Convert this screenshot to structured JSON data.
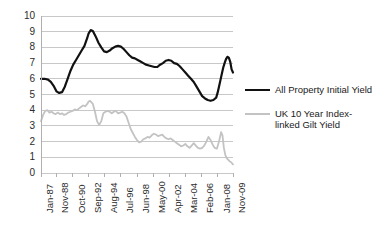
{
  "chart_data": {
    "type": "line",
    "title": "",
    "subtitle": "",
    "xlabel": "",
    "ylabel": "",
    "ylim": [
      0,
      10
    ],
    "ytick_labels": [
      "0",
      "1",
      "2",
      "3",
      "4",
      "5",
      "6",
      "7",
      "8",
      "9",
      "10"
    ],
    "ytick_values": [
      0,
      1,
      2,
      3,
      4,
      5,
      6,
      7,
      8,
      9,
      10
    ],
    "grid": true,
    "legend_position": "right",
    "xtick_labels": [
      "Jan-87",
      "Nov-88",
      "Oct-90",
      "Sep-92",
      "Aug-94",
      "Jul-96",
      "Jun-98",
      "May-00",
      "Apr-02",
      "Mar-04",
      "Feb-06",
      "Jan-08",
      "Nov-09"
    ],
    "xtick_positions": [
      0,
      22,
      45,
      68,
      91,
      114,
      137,
      160,
      183,
      206,
      229,
      252,
      274
    ],
    "x_range": [
      0,
      274
    ],
    "x_unit": "months since Jan-1987",
    "series": [
      {
        "name": "All Property Initial Yield",
        "color": "#111111",
        "width": 2.2,
        "x": [
          0,
          5,
          10,
          14,
          18,
          22,
          26,
          30,
          34,
          38,
          42,
          46,
          50,
          54,
          58,
          62,
          66,
          68,
          71,
          74,
          78,
          82,
          86,
          90,
          94,
          98,
          102,
          106,
          110,
          114,
          118,
          122,
          126,
          130,
          134,
          138,
          142,
          146,
          150,
          154,
          158,
          162,
          166,
          170,
          174,
          178,
          182,
          186,
          190,
          194,
          198,
          202,
          206,
          210,
          214,
          218,
          222,
          226,
          230,
          234,
          238,
          242,
          246,
          250,
          252,
          254,
          256,
          258,
          260,
          262,
          264,
          266,
          268,
          270,
          272,
          274
        ],
        "values": [
          6.0,
          6.0,
          5.95,
          5.8,
          5.55,
          5.2,
          5.1,
          5.15,
          5.5,
          6.0,
          6.5,
          6.9,
          7.2,
          7.5,
          7.8,
          8.1,
          8.6,
          8.9,
          9.1,
          9.05,
          8.7,
          8.3,
          8.0,
          7.75,
          7.7,
          7.8,
          7.95,
          8.05,
          8.1,
          8.05,
          7.9,
          7.7,
          7.5,
          7.35,
          7.3,
          7.2,
          7.1,
          7.0,
          6.9,
          6.85,
          6.8,
          6.75,
          6.75,
          6.9,
          7.0,
          7.15,
          7.2,
          7.15,
          7.0,
          6.95,
          6.8,
          6.6,
          6.4,
          6.2,
          6.0,
          5.8,
          5.5,
          5.2,
          4.9,
          4.75,
          4.65,
          4.6,
          4.65,
          4.8,
          5.1,
          5.5,
          5.9,
          6.3,
          6.7,
          7.0,
          7.25,
          7.4,
          7.35,
          7.1,
          6.6,
          6.4
        ]
      },
      {
        "name": "UK 10 Year Index-linked Gilt Yield",
        "color": "#c3c3c3",
        "width": 1.8,
        "x": [
          0,
          3,
          6,
          9,
          12,
          15,
          18,
          21,
          24,
          27,
          30,
          33,
          36,
          39,
          42,
          45,
          48,
          51,
          54,
          57,
          60,
          63,
          66,
          68,
          70,
          72,
          74,
          77,
          80,
          83,
          86,
          89,
          92,
          95,
          98,
          101,
          104,
          107,
          110,
          113,
          116,
          119,
          122,
          125,
          128,
          131,
          134,
          137,
          140,
          143,
          146,
          149,
          152,
          155,
          158,
          161,
          164,
          167,
          170,
          173,
          176,
          179,
          182,
          185,
          188,
          191,
          194,
          197,
          200,
          203,
          206,
          209,
          212,
          215,
          218,
          221,
          224,
          227,
          230,
          233,
          236,
          239,
          242,
          245,
          248,
          251,
          254,
          257,
          259,
          261,
          263,
          265,
          267,
          269,
          271,
          273,
          274
        ],
        "values": [
          3.3,
          3.7,
          3.95,
          4.0,
          3.85,
          3.9,
          3.8,
          3.75,
          3.85,
          3.75,
          3.8,
          3.7,
          3.75,
          3.85,
          3.9,
          3.95,
          4.05,
          4.0,
          4.1,
          4.2,
          4.3,
          4.25,
          4.4,
          4.55,
          4.6,
          4.5,
          4.4,
          3.9,
          3.3,
          3.05,
          3.3,
          3.8,
          3.9,
          3.95,
          3.9,
          3.8,
          3.9,
          3.95,
          3.8,
          3.85,
          3.9,
          3.8,
          3.6,
          3.2,
          2.8,
          2.55,
          2.3,
          2.1,
          1.95,
          2.0,
          2.15,
          2.2,
          2.3,
          2.25,
          2.4,
          2.5,
          2.45,
          2.35,
          2.4,
          2.45,
          2.3,
          2.2,
          2.15,
          2.2,
          2.1,
          2.0,
          1.9,
          1.8,
          1.7,
          1.75,
          1.85,
          1.7,
          1.6,
          1.75,
          1.9,
          1.75,
          1.6,
          1.55,
          1.6,
          1.75,
          2.0,
          2.3,
          2.1,
          1.8,
          1.6,
          1.55,
          2.0,
          2.6,
          2.4,
          1.6,
          1.15,
          0.95,
          0.85,
          0.75,
          0.7,
          0.6,
          0.55
        ]
      }
    ]
  },
  "legend": {
    "entries": [
      {
        "label": "All Property Initial Yield",
        "color": "#111111"
      },
      {
        "label": "UK 10 Year Index-linked Gilt Yield",
        "color": "#c3c3c3"
      }
    ]
  },
  "axes": {
    "axis_color": "#b0b0b0",
    "grid_color": "#c8c8c8",
    "tick_text_color": "#2b2b2b"
  }
}
